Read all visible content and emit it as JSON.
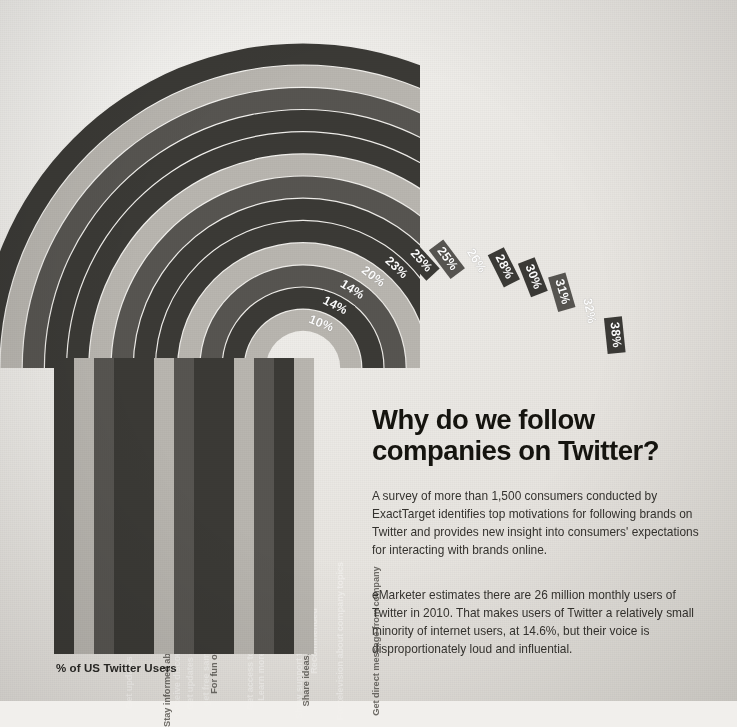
{
  "poster": {
    "headline_line1": "Why do we follow",
    "headline_line2": "companies on Twitter?",
    "paragraph1": "A survey of more than 1,500 consumers conducted by ExactTarget identifies top motivations for following brands on Twitter and provides new insight into consumers' expectations for interacting with brands online.",
    "paragraph2": "eMarketer estimates there are 26 million monthly users of Twitter in 2010. That makes users of Twitter a relatively small minority of internet users, at 14.6%, but their voice is disproportionately loud and influential.",
    "axis_label": "% of US Twitter Users"
  },
  "colors": {
    "background": "#eceae6",
    "dark_band": "#3b3a36",
    "mid_band": "#575551",
    "light_band": "#b9b6b0",
    "pale_band": "#d2cfc9",
    "label_text_light": "#f2f0ed",
    "label_text_dark": "#6f6c67",
    "headline": "#15140f",
    "body_text": "#35332f"
  },
  "chart_data": {
    "type": "bar",
    "title": "Why do we follow companies on Twitter?",
    "subtitle": "% of US Twitter Users",
    "xlabel": "",
    "ylabel": "% of US Twitter Users",
    "ylim": [
      0,
      40
    ],
    "grid": false,
    "legend": "none",
    "note": "Radial arc chart: each concentric arc is one reason, radius proportional to percentage.",
    "categories": [
      "Get updates on future products",
      "Stay informed about company activities",
      "Receive discounts and promotions",
      "Get updates on upcoming sales",
      "get free samples, coupons etc",
      "For fun or entertainment",
      "Get access to exclusive content",
      "Learn more about company",
      "Show support to company to others",
      "Share ideas, provide feedback",
      "For television about company topics",
      "Recommended",
      "Get direct message from company"
    ],
    "values": [
      38,
      32,
      31,
      30,
      28,
      26,
      25,
      25,
      23,
      20,
      14,
      14,
      10
    ],
    "value_labels": [
      "38%",
      "32%",
      "31%",
      "30%",
      "28%",
      "26%",
      "25%",
      "25%",
      "23%",
      "20%",
      "14%",
      "14%",
      "10%"
    ],
    "tones": [
      "dark",
      "light",
      "mid",
      "dark",
      "dark",
      "light",
      "mid",
      "dark",
      "dark",
      "light",
      "mid",
      "dark",
      "light"
    ]
  }
}
